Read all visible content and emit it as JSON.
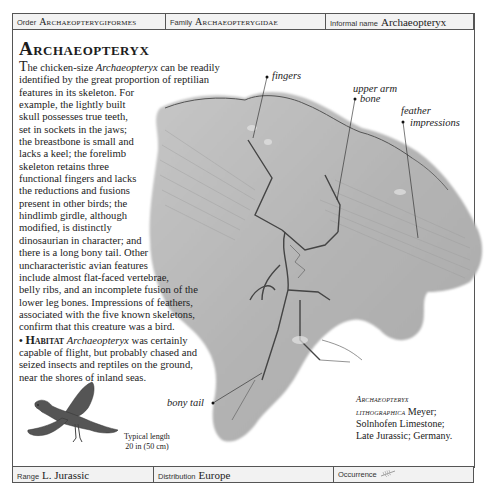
{
  "header": {
    "order_label": "Order",
    "order_value": "Archaeopterygiformes",
    "family_label": "Family",
    "family_value": "Archaeopterygidae",
    "informal_label": "Informal name",
    "informal_value": "Archaeopteryx"
  },
  "title": "Archaeopteryx",
  "body": {
    "lines": [
      "he chicken-size ",
      "identified by the great proportion of reptilian",
      "features in its skeleton. For",
      "example, the lightly built",
      "skull possesses true teeth,",
      "set in sockets in the jaws;",
      "the breastbone is small and",
      "lacks a keel; the forelimb",
      "skeleton retains three",
      "functional fingers and lacks",
      "the reductions and fusions",
      "present in other birds; the",
      "hindlimb girdle, although",
      "modified, is distinctly",
      "dinosaurian in character; and",
      "there is a long bony tail. Other",
      "uncharacteristic avian features",
      "include almost flat-faced vertebrae,",
      "belly ribs, and an incomplete fusion of the",
      "lower leg bones. Impressions of feathers,",
      "associated with the five known skeletons,",
      "confirm that this creature was a bird."
    ],
    "dropcap": "T",
    "genus_italic": "Archaeopteryx",
    "line1_tail": " can be readily",
    "habitat_bullet": "•",
    "habitat_heading": "Habitat",
    "habitat_genus": "Archaeopteryx",
    "habitat_line1_tail": " was certainly",
    "habitat_lines": [
      "capable of flight, but probably chased and",
      "seized insects and reptiles on the ground,",
      "near the shores of inland seas."
    ]
  },
  "annotations": {
    "fingers": "fingers",
    "upper_arm_1": "upper arm",
    "upper_arm_2": "bone",
    "feather_1": "feather",
    "feather_2": "impressions",
    "bony_tail": "bony tail"
  },
  "caption": {
    "species_1": "Archaeopteryx",
    "species_2": "lithographica",
    "author": " Meyer;",
    "line3": "Solnhofen Limestone;",
    "line4": "Late Jurassic; Germany."
  },
  "length": {
    "label": "Typical length",
    "value": "20 in (50 cm)"
  },
  "footer": {
    "range_label": "Range",
    "range_value": "L. Jurassic",
    "distribution_label": "Distribution",
    "distribution_value": "Europe",
    "occurrence_label": "Occurrence",
    "occurrence_icon": "feather-icon"
  },
  "colors": {
    "bar_bg": "#f2f2f2",
    "border": "#555555",
    "fossil_stone": "#b9b9b9"
  }
}
